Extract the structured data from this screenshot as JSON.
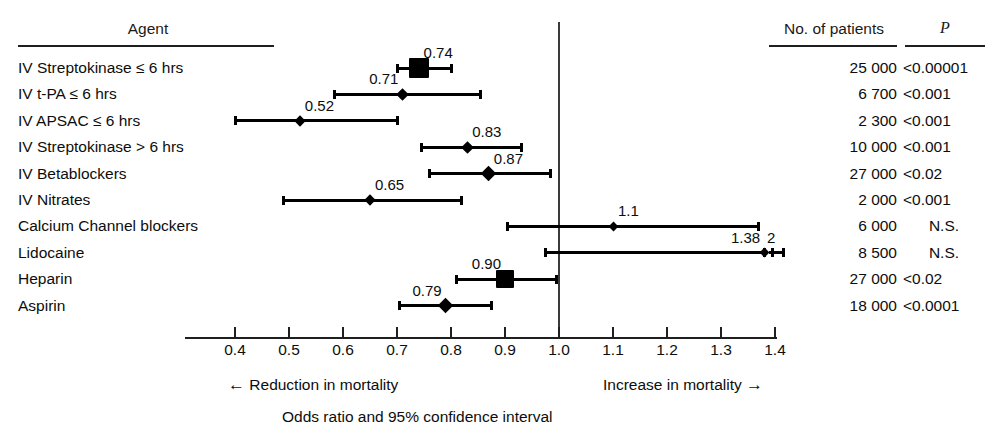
{
  "headers": {
    "agent": "Agent",
    "patients": "No. of patients",
    "p": "P"
  },
  "axis": {
    "ticks": [
      "0.4",
      "0.5",
      "0.6",
      "0.7",
      "0.8",
      "0.9",
      "1.0",
      "1.1",
      "1.2",
      "1.3",
      "1.4"
    ],
    "reduction_note": "Reduction in mortality",
    "increase_note": "Increase in mortality",
    "caption": "Odds ratio and 95% confidence interval",
    "left_arrow": "←",
    "right_arrow": "→",
    "null_line_value": "1.0"
  },
  "rows": [
    {
      "agent": "IV Streptokinase ≤  6 hrs",
      "or_label": "0.74",
      "or": 0.74,
      "ci_low": 0.7,
      "ci_high": 0.8,
      "patients": "25 000",
      "p": "<0.00001",
      "marker": "box",
      "marker_size": 20,
      "label_side": "right"
    },
    {
      "agent": "IV t-PA ≤ 6 hrs",
      "or_label": "0.71",
      "or": 0.71,
      "ci_low": 0.585,
      "ci_high": 0.855,
      "patients": "6 700",
      "p": "<0.001",
      "marker": "diamond",
      "marker_size": 9,
      "label_side": "left"
    },
    {
      "agent": "IV APSAC ≤ 6 hrs",
      "or_label": "0.52",
      "or": 0.52,
      "ci_low": 0.4,
      "ci_high": 0.7,
      "patients": "2 300",
      "p": "<0.001",
      "marker": "diamond",
      "marker_size": 8,
      "label_side": "right"
    },
    {
      "agent": "IV Streptokinase > 6 hrs",
      "or_label": "0.83",
      "or": 0.83,
      "ci_low": 0.745,
      "ci_high": 0.93,
      "patients": "10 000",
      "p": "<0.001",
      "marker": "diamond",
      "marker_size": 9,
      "label_side": "right"
    },
    {
      "agent": "IV Betablockers",
      "or_label": "0.87",
      "or": 0.87,
      "ci_low": 0.76,
      "ci_high": 0.985,
      "patients": "27 000",
      "p": "<0.02",
      "marker": "diamond",
      "marker_size": 11,
      "label_side": "right"
    },
    {
      "agent": "IV Nitrates",
      "or_label": "0.65",
      "or": 0.65,
      "ci_low": 0.49,
      "ci_high": 0.82,
      "patients": "2 000",
      "p": "<0.001",
      "marker": "diamond",
      "marker_size": 8,
      "label_side": "right"
    },
    {
      "agent": "Calcium Channel blockers",
      "or_label": "1.1",
      "or": 1.1,
      "ci_low": 0.905,
      "ci_high": 1.37,
      "patients": "6 000",
      "p": "N.S.",
      "marker": "diamond",
      "marker_size": 7,
      "label_side": "right"
    },
    {
      "agent": "Lidocaine",
      "or_label": "1.38",
      "or": 1.38,
      "ci_low": 0.975,
      "ci_high": 1.38,
      "patients": "8 500",
      "p": "N.S.",
      "marker": "diamond",
      "marker_size": 7,
      "label_side": "left",
      "truncated_high_label": "2",
      "truncated_high": 1.415,
      "dotted_from": 1.355,
      "dotted_to": 1.395
    },
    {
      "agent": "Heparin",
      "or_label": "0.90",
      "or": 0.9,
      "ci_low": 0.81,
      "ci_high": 0.995,
      "patients": "27 000",
      "p": "<0.02",
      "marker": "box",
      "marker_size": 18,
      "label_side": "left"
    },
    {
      "agent": "Aspirin",
      "or_label": "0.79",
      "or": 0.79,
      "ci_low": 0.705,
      "ci_high": 0.875,
      "patients": "18 000",
      "p": "<0.0001",
      "marker": "diamond",
      "marker_size": 11,
      "label_side": "left"
    }
  ],
  "chart_data": {
    "type": "forest",
    "title": "Odds ratio and 95% confidence interval",
    "xlabel": "Odds ratio",
    "ylabel": "Agent",
    "xlim": [
      0.4,
      1.4
    ],
    "x_ticks": [
      0.4,
      0.5,
      0.6,
      0.7,
      0.8,
      0.9,
      1.0,
      1.1,
      1.2,
      1.3,
      1.4
    ],
    "reference_line": 1.0,
    "grid": false,
    "legend": "none",
    "categories": [
      "IV Streptokinase ≤ 6 hrs",
      "IV t-PA ≤ 6 hrs",
      "IV APSAC ≤ 6 hrs",
      "IV Streptokinase > 6 hrs",
      "IV Betablockers",
      "IV Nitrates",
      "Calcium Channel blockers",
      "Lidocaine",
      "Heparin",
      "Aspirin"
    ],
    "odds_ratios": [
      0.74,
      0.71,
      0.52,
      0.83,
      0.87,
      0.65,
      1.1,
      1.38,
      0.9,
      0.79
    ],
    "ci_low": [
      0.7,
      0.585,
      0.4,
      0.745,
      0.76,
      0.49,
      0.905,
      0.975,
      0.81,
      0.705
    ],
    "ci_high": [
      0.8,
      0.855,
      0.7,
      0.93,
      0.985,
      0.82,
      1.37,
      2.0,
      0.995,
      0.875
    ],
    "n_patients": [
      25000,
      6700,
      2300,
      10000,
      27000,
      2000,
      6000,
      8500,
      27000,
      18000
    ],
    "p_values": [
      "<0.00001",
      "<0.001",
      "<0.001",
      "<0.001",
      "<0.02",
      "<0.001",
      "N.S.",
      "N.S.",
      "<0.02",
      "<0.0001"
    ],
    "annotations": [
      "← Reduction in mortality",
      "Increase in mortality →"
    ]
  }
}
